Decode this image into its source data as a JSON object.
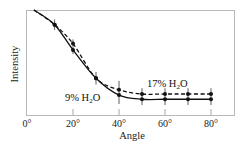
{
  "chart_data": {
    "type": "line",
    "title": "",
    "xlabel": "Angle",
    "ylabel": "Intensity",
    "xlim": [
      0,
      90
    ],
    "ylim": [
      0,
      1
    ],
    "x_ticks": [
      0,
      20,
      40,
      60,
      80
    ],
    "x_tick_labels": [
      "0°",
      "20°",
      "40°",
      "60°",
      "80°"
    ],
    "y_ticks": [],
    "grid": false,
    "legend": "inline labels",
    "x": [
      12,
      20,
      30,
      40,
      50,
      60,
      70,
      80
    ],
    "series": [
      {
        "name": "17% H2O",
        "label_main": "17% H",
        "label_sub": "2",
        "label_end": "O",
        "line_style": "dashed",
        "color": "#111111",
        "values": [
          0.86,
          0.68,
          0.35,
          0.24,
          0.2,
          0.2,
          0.2,
          0.2
        ]
      },
      {
        "name": "9% H2O",
        "label_main": "9% H",
        "label_sub": "2",
        "label_end": "O",
        "line_style": "solid",
        "color": "#111111",
        "values": [
          0.86,
          0.62,
          0.35,
          0.19,
          0.15,
          0.15,
          0.15,
          0.15
        ]
      }
    ],
    "error_bars": {
      "x": [
        12,
        20,
        30,
        40,
        50,
        60,
        70,
        80
      ],
      "half_height": [
        0.05,
        0.07,
        0.06,
        0.11,
        0.08,
        0.08,
        0.08,
        0.08
      ]
    },
    "fit_curve_start": {
      "x": 3,
      "y": 1.0
    }
  }
}
